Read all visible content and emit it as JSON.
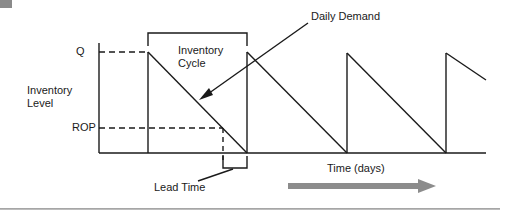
{
  "diagram": {
    "type": "inventory-sawtooth",
    "labels": {
      "q": "Q",
      "rop": "ROP",
      "y_axis_line1": "Inventory",
      "y_axis_line2": "Level",
      "cycle_line1": "Inventory",
      "cycle_line2": "Cycle",
      "daily_demand": "Daily Demand",
      "lead_time": "Lead Time",
      "x_axis": "Time (days)"
    },
    "colors": {
      "line": "#1a1a1a",
      "arrow": "#8c8c8c",
      "rule": "#a8a8a8",
      "corner_tab": "#8a8a8a"
    },
    "cycles": 4
  }
}
